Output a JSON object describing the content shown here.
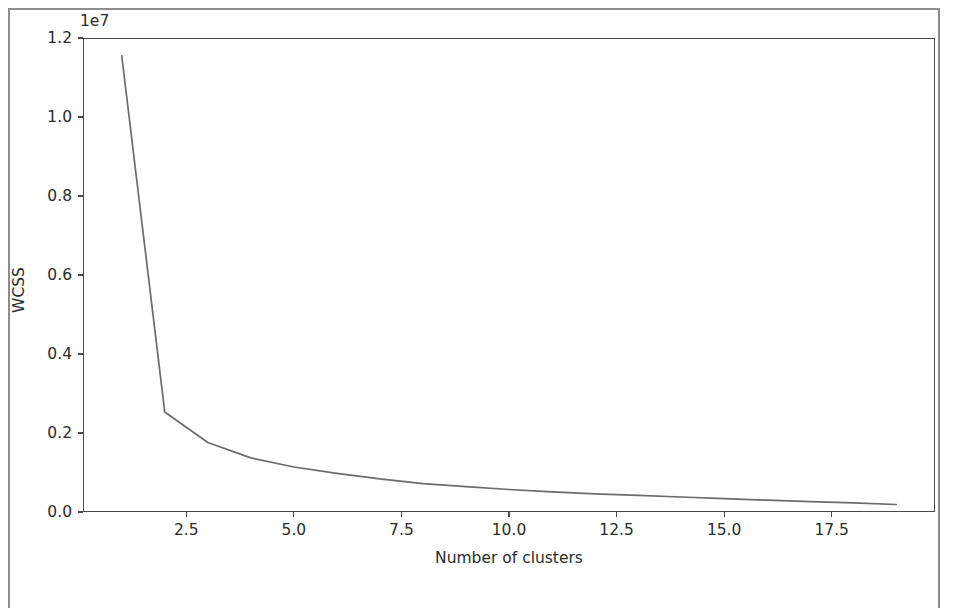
{
  "figure": {
    "y_offset_text": "1e7",
    "x_axis_label": "Number of clusters",
    "y_axis_label": "WCSS",
    "line_color": "#6b6b6b",
    "axis_color": "#4a4a4a",
    "background_color": "#ffffff"
  },
  "chart_data": {
    "type": "line",
    "title": "",
    "xlabel": "Number of clusters",
    "ylabel": "WCSS",
    "y_offset": "1e7",
    "y_offset_value": 10000000,
    "xlim": [
      0.1,
      19.9
    ],
    "ylim": [
      0,
      12000000
    ],
    "grid": false,
    "legend": null,
    "xticks": [
      2.5,
      5.0,
      7.5,
      10.0,
      12.5,
      15.0,
      17.5
    ],
    "xtick_labels": [
      "2.5",
      "5.0",
      "7.5",
      "10.0",
      "12.5",
      "15.0",
      "17.5"
    ],
    "yticks": [
      0,
      2000000,
      4000000,
      6000000,
      8000000,
      10000000,
      12000000
    ],
    "ytick_labels": [
      "0.0",
      "0.2",
      "0.4",
      "0.6",
      "0.8",
      "1.0",
      "1.2"
    ],
    "x": [
      1,
      2,
      3,
      4,
      5,
      6,
      7,
      8,
      9,
      10,
      11,
      12,
      13,
      14,
      15,
      16,
      17,
      18,
      19
    ],
    "series": [
      {
        "name": "WCSS",
        "values": [
          11550000,
          2530000,
          1760000,
          1370000,
          1140000,
          980000,
          840000,
          720000,
          640000,
          570000,
          510000,
          460000,
          420000,
          380000,
          340000,
          300000,
          265000,
          230000,
          190000
        ]
      }
    ]
  }
}
